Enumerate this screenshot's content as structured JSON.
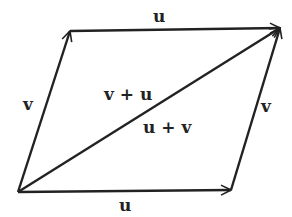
{
  "diagram": {
    "stroke_color": "#222222",
    "background": "#ffffff",
    "vertices": {
      "origin": [
        18,
        192
      ],
      "v_end": [
        70,
        31
      ],
      "u_end": [
        231,
        190
      ],
      "sum_end": [
        280,
        28
      ]
    },
    "labels": {
      "top_u": "u",
      "bottom_u": "u",
      "left_v": "v",
      "right_v": "v",
      "diag_upper": "v + u",
      "diag_lower": "u + v"
    }
  }
}
